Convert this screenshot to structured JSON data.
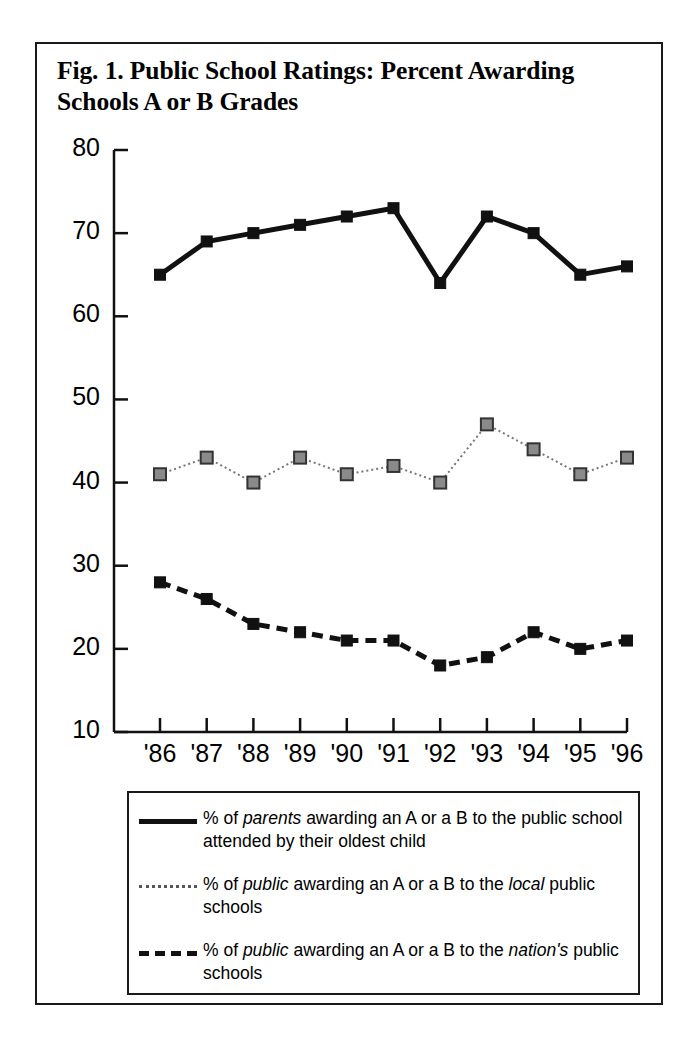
{
  "figure": {
    "title": "Fig. 1. Public School Ratings: Percent Awarding Schools A or B Grades",
    "border_color": "#1a1a1a",
    "background_color": "#ffffff"
  },
  "legend": {
    "entries": [
      {
        "style": "solid",
        "sample_name": "legend-line-solid",
        "text_parts": [
          {
            "text": "% of ",
            "italic": false
          },
          {
            "text": "parents",
            "italic": true
          },
          {
            "text": " awarding an A or a B to the public school attended by their oldest child",
            "italic": false
          }
        ],
        "plain_text": "% of parents awarding an A or a B to the public school attended by their oldest child"
      },
      {
        "style": "dotted",
        "sample_name": "legend-line-dotted",
        "text_parts": [
          {
            "text": "% of ",
            "italic": false
          },
          {
            "text": "public",
            "italic": true
          },
          {
            "text": " awarding an A or a B to the ",
            "italic": false
          },
          {
            "text": "local",
            "italic": true
          },
          {
            "text": " public schools",
            "italic": false
          }
        ],
        "plain_text": "% of public awarding an A or a B to the local public schools"
      },
      {
        "style": "dashed",
        "sample_name": "legend-line-dashed",
        "text_parts": [
          {
            "text": "% of ",
            "italic": false
          },
          {
            "text": "public",
            "italic": true
          },
          {
            "text": " awarding an A or a B to the ",
            "italic": false
          },
          {
            "text": "nation's",
            "italic": true
          },
          {
            "text": " public schools",
            "italic": false
          }
        ],
        "plain_text": "% of public awarding an A or a B to the nation's public schools"
      }
    ]
  },
  "chart_data": {
    "type": "line",
    "title": "Fig. 1. Public School Ratings: Percent Awarding Schools A or B Grades",
    "xlabel": "",
    "ylabel": "",
    "grid": false,
    "legend_position": "below-plot",
    "categories": [
      "'86",
      "'87",
      "'88",
      "'89",
      "'90",
      "'91",
      "'92",
      "'93",
      "'94",
      "'95",
      "'96"
    ],
    "x": [
      "'86",
      "'87",
      "'88",
      "'89",
      "'90",
      "'91",
      "'92",
      "'93",
      "'94",
      "'95",
      "'96"
    ],
    "ylim": [
      10,
      80
    ],
    "yticks": [
      10,
      20,
      30,
      40,
      50,
      60,
      70,
      80
    ],
    "series": [
      {
        "name": "% of parents awarding an A or a B to the public school attended by their oldest child",
        "short_name": "parents-own-school",
        "line_style": "solid",
        "line_width": 5,
        "color": "#111111",
        "marker": "filled-square",
        "marker_color": "#111111",
        "values": [
          65,
          69,
          70,
          71,
          72,
          73,
          64,
          72,
          70,
          65,
          66
        ]
      },
      {
        "name": "% of public awarding an A or a B to the local public schools",
        "short_name": "public-local-schools",
        "line_style": "dotted",
        "line_width": 2,
        "color": "#777777",
        "marker": "gray-square",
        "marker_color": "#8a8a8a",
        "marker_edge_color": "#333333",
        "values": [
          41,
          43,
          40,
          43,
          41,
          42,
          40,
          47,
          44,
          41,
          43
        ]
      },
      {
        "name": "% of public awarding an A or a B to the nation's public schools",
        "short_name": "public-national-schools",
        "line_style": "dashed",
        "line_width": 5,
        "color": "#111111",
        "marker": "filled-square",
        "marker_color": "#111111",
        "values": [
          28,
          26,
          23,
          22,
          21,
          21,
          18,
          19,
          22,
          20,
          21
        ]
      }
    ]
  }
}
